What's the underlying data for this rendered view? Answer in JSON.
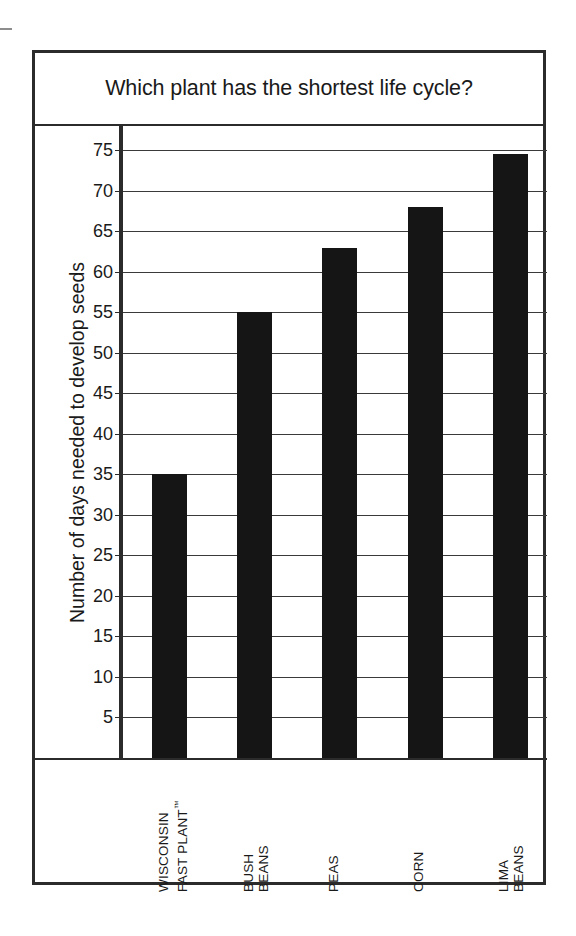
{
  "chart_data": {
    "type": "bar",
    "title": "Which plant has the shortest life cycle?",
    "xlabel": "",
    "ylabel": "Number of days needed to develop seeds",
    "categories": [
      "WISCONSIN FAST PLANT™",
      "BUSH BEANS",
      "PEAS",
      "CORN",
      "LIMA BEANS"
    ],
    "category_lines": [
      [
        "WISCONSIN",
        "FAST PLANT™"
      ],
      [
        "BUSH",
        "BEANS"
      ],
      [
        "PEAS"
      ],
      [
        "CORN"
      ],
      [
        "LIMA",
        "BEANS"
      ]
    ],
    "values": [
      35,
      55,
      63,
      68,
      74.5
    ],
    "ylim": [
      0,
      78
    ],
    "ytick_values": [
      5,
      10,
      15,
      20,
      25,
      30,
      35,
      40,
      45,
      50,
      55,
      60,
      65,
      70,
      75
    ],
    "ytick_labels": [
      "5",
      "10",
      "15",
      "20",
      "25",
      "30",
      "35",
      "40",
      "45",
      "50",
      "55",
      "60",
      "65",
      "70",
      "75"
    ],
    "grid": true,
    "legend": false,
    "bar_color": "#151515",
    "frame_color": "#2b2b2b",
    "background_color": "#ffffff"
  }
}
